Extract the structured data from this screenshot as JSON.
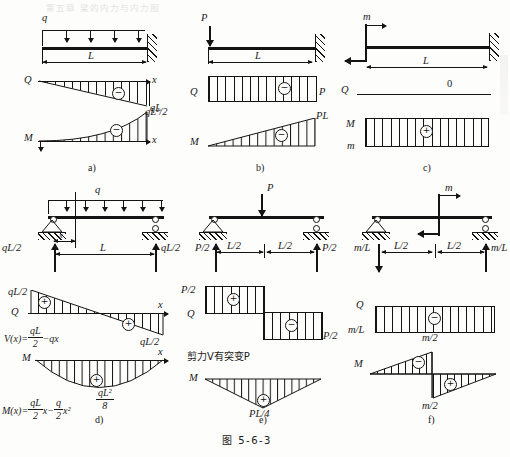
{
  "caption": "图  5-6-3",
  "bleed_header_text": "第五章 梁的内力与内力图",
  "panels": [
    {
      "tag": "a)",
      "load_label": "q",
      "span_label": "L",
      "shear": {
        "symbol": "Q",
        "axis_label": "x",
        "value_label": "qL",
        "sign": "−"
      },
      "moment": {
        "symbol": "M",
        "axis_label": "x",
        "value_label": "qL²/2",
        "sign": "−"
      }
    },
    {
      "tag": "b)",
      "load_label": "P",
      "span_label": "L",
      "shear": {
        "symbol": "Q",
        "value_label": "P",
        "sign": "−"
      },
      "moment": {
        "symbol": "M",
        "value_label": "PL",
        "sign": "−"
      }
    },
    {
      "tag": "c)",
      "load_label": "m",
      "span_label": "L",
      "shear": {
        "symbol": "Q",
        "value_label": "0"
      },
      "moment": {
        "symbol": "M",
        "value_label": "m",
        "sign": "+"
      }
    },
    {
      "tag": "d)",
      "load_label": "q",
      "span_label": "L",
      "dist_label": "x",
      "reaction_left": "qL/2",
      "reaction_right": "qL/2",
      "shear": {
        "symbol": "Q",
        "axis_label": "x",
        "value_left": "qL/2",
        "value_right": "qL/2",
        "sign_left": "+",
        "sign_right": "+",
        "formula_lhs": "V(x)=",
        "formula_num": "qL",
        "formula_den": "2",
        "formula_tail": "−qx"
      },
      "moment": {
        "symbol": "M",
        "axis_label": "x",
        "sign": "+",
        "peak_num": "qL²",
        "peak_den": "8",
        "formula_lhs": "M(x)=",
        "f1_num": "qL",
        "f1_den": "2",
        "f1_tail": "x−",
        "f2_num": "q",
        "f2_den": "2",
        "f2_tail": "x²"
      }
    },
    {
      "tag": "e)",
      "load_label": "P",
      "half_left": "L/2",
      "half_right": "L/2",
      "reaction_left": "P/2",
      "reaction_right": "P/2",
      "note": "剪力V有突变P",
      "shear": {
        "symbol": "Q",
        "value_left": "P/2",
        "value_right": "P/2",
        "sign_left": "+",
        "sign_right": "−"
      },
      "moment": {
        "symbol": "M",
        "peak_label": "PL/4",
        "sign": "+"
      }
    },
    {
      "tag": "f)",
      "load_label": "m",
      "half_left": "L/2",
      "half_right": "L/2",
      "reaction_left": "m/L",
      "reaction_right": "m/L",
      "shear": {
        "symbol": "Q",
        "value_label": "m/L",
        "peak_label": "m/2",
        "sign": "−"
      },
      "moment": {
        "symbol": "M",
        "peak_label": "m/2",
        "sign_left": "−",
        "sign_right": "+"
      }
    }
  ]
}
